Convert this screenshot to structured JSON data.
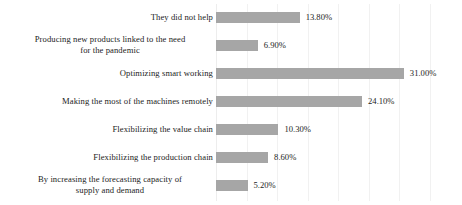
{
  "chart_data": {
    "type": "bar",
    "orientation": "horizontal",
    "title": "",
    "subtitle": "",
    "xlabel": "",
    "ylabel": "",
    "xlim": [
      0,
      36
    ],
    "grid": true,
    "gridline_step": 5,
    "legend": false,
    "legend_position": "none",
    "bar_color": "#a6a6a6",
    "gridline_color": "#f1f1f1",
    "label_color": "#1c1c1c",
    "categories": [
      "They did not help",
      "Producing new products linked to the need for the pandemic",
      "Optimizing smart working",
      "Making the most of the machines remotely",
      "Flexibilizing the value chain",
      "Flexibilizing the production chain",
      "By increasing the forecasting capacity of supply and demand"
    ],
    "values": [
      13.8,
      6.9,
      31.0,
      24.1,
      10.3,
      8.6,
      5.2
    ],
    "value_labels": [
      "13.80%",
      "6.90%",
      "31.00%",
      "24.10%",
      "10.30%",
      "8.60%",
      "5.20%"
    ],
    "bars": [
      {
        "label": "They did not help",
        "label_lines": [
          "They did not help"
        ],
        "value": 13.8,
        "value_label": "13.80%"
      },
      {
        "label": "Producing new products linked to the need for the pandemic",
        "label_lines": [
          "Producing new products linked to the need",
          "for the pandemic"
        ],
        "value": 6.9,
        "value_label": "6.90%"
      },
      {
        "label": "Optimizing smart working",
        "label_lines": [
          "Optimizing smart working"
        ],
        "value": 31.0,
        "value_label": "31.00%"
      },
      {
        "label": "Making the most of the machines remotely",
        "label_lines": [
          "Making the most of the machines remotely"
        ],
        "value": 24.1,
        "value_label": "24.10%"
      },
      {
        "label": "Flexibilizing the value chain",
        "label_lines": [
          "Flexibilizing the value chain"
        ],
        "value": 10.3,
        "value_label": "10.30%"
      },
      {
        "label": "Flexibilizing the production chain",
        "label_lines": [
          "Flexibilizing the production chain"
        ],
        "value": 8.6,
        "value_label": "8.60%"
      },
      {
        "label": "By increasing the forecasting capacity of supply and demand",
        "label_lines": [
          "By increasing the forecasting capacity of",
          "supply and demand"
        ],
        "value": 5.2,
        "value_label": "5.20%"
      }
    ]
  },
  "layout": {
    "plot_left_px": 216,
    "px_per_percent": 6.06,
    "row_pitch_px": 28,
    "first_row_top_px": 3,
    "bar_height_px": 11,
    "gridline_positions_px": [
      216,
      247,
      277,
      308,
      338,
      369,
      399,
      430
    ]
  }
}
